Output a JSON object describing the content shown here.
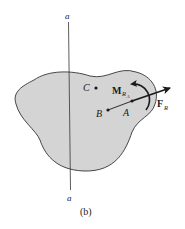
{
  "diagram": {
    "caption": "(b)",
    "axis": {
      "top_label": "a",
      "bottom_label": "a"
    },
    "points": [
      {
        "name": "C",
        "label": "C"
      },
      {
        "name": "B",
        "label": "B"
      },
      {
        "name": "A",
        "label": "A"
      }
    ],
    "force": {
      "symbol": "F",
      "subscript": "R"
    },
    "moment": {
      "symbol": "M",
      "subscript": "R",
      "sub_subscript": "A"
    },
    "colors": {
      "body_fill": "#d4d4d4",
      "outline": "#333333",
      "ink": "#1a1a1a",
      "background": "#ffffff"
    }
  }
}
